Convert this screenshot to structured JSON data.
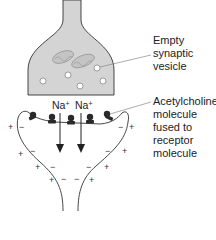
{
  "diagram": {
    "colors": {
      "terminal_fill": "#d4d4d4",
      "outline": "#333333",
      "vesicle_fill": "#ffffff",
      "molecule": "#2a2a2a",
      "leader_line": "#888888"
    },
    "labels": {
      "vesicle": [
        "Empty",
        "synaptic",
        "vesicle"
      ],
      "acetylcholine": [
        "Acetylcholine",
        "molecule",
        "fused to",
        "receptor",
        "molecule"
      ]
    },
    "ions": [
      {
        "symbol": "Na",
        "charge": "+"
      },
      {
        "symbol": "Na",
        "charge": "+"
      }
    ],
    "charges": {
      "outside": "+",
      "inside": "−"
    },
    "vesicle_count": 5,
    "mitochondria_count": 2,
    "receptor_molecule_count": 5,
    "arrow_count": 2
  }
}
